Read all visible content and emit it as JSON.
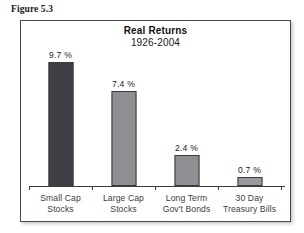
{
  "figure": {
    "caption": "Figure 5.3"
  },
  "chart_data": {
    "type": "bar",
    "title": "Real Returns",
    "subtitle": "1926-2004",
    "xlabel": "",
    "ylabel": "",
    "grid": false,
    "legend": false,
    "ylim": [
      0,
      10.4
    ],
    "categories": [
      "Small Cap\nStocks",
      "Large Cap\nStocks",
      "Long Term\nGov't Bonds",
      "30 Day\nTreasury Bills"
    ],
    "category_lines": [
      [
        "Small Cap",
        "Stocks"
      ],
      [
        "Large Cap",
        "Stocks"
      ],
      [
        "Long Term",
        "Gov't Bonds"
      ],
      [
        "30 Day",
        "Treasury Bills"
      ]
    ],
    "values": [
      9.7,
      7.4,
      2.4,
      0.7
    ],
    "value_labels": [
      "9.7 %",
      "7.4 %",
      "2.4 %",
      "0.7 %"
    ],
    "bar_colors": [
      "#3f3f45",
      "#8e8e93",
      "#8e8e93",
      "#9a9a9f"
    ],
    "bar_border_color": "#3a3a40",
    "units": "percent"
  }
}
